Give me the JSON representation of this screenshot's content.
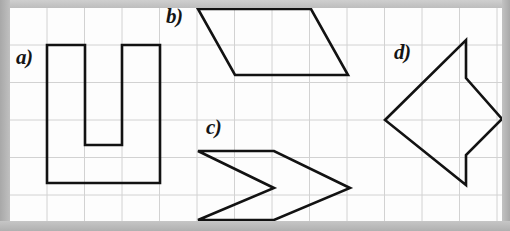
{
  "figure": {
    "background_color": "#bdbdbd",
    "panel_color": "#fdfdfd",
    "grid": {
      "line_color": "#d2d2d2",
      "cell_size": 37.5,
      "origin_x": 9.5,
      "origin_y": 7.5,
      "columns": 13,
      "rows": 6,
      "width": 494,
      "height": 215
    },
    "stroke_color": "#121212",
    "stroke_width": 2.6,
    "labels": [
      {
        "key": "a",
        "text": "a)",
        "x": 16,
        "y": 47
      },
      {
        "key": "b",
        "text": "b)",
        "x": 166,
        "y": 6
      },
      {
        "key": "c",
        "text": "c)",
        "x": 206,
        "y": 117
      },
      {
        "key": "d",
        "text": "d)",
        "x": 394,
        "y": 42
      }
    ],
    "shapes": [
      {
        "key": "a",
        "name": "u-shape-hexagon",
        "label": "a)",
        "vertex_count": 8,
        "points": "47,45 85,45 85,145 122,145 122,45 160,45 160,183 47,183"
      },
      {
        "key": "b",
        "name": "parallelogram",
        "label": "b)",
        "vertex_count": 4,
        "points": "198,9 311,9 348,75 235,75"
      },
      {
        "key": "c",
        "name": "chevron-arrow",
        "label": "c)",
        "vertex_count": 5,
        "points": "198,151 274,151 350,188 274,220 198,220 274,188"
      },
      {
        "key": "d",
        "name": "arrow-kite",
        "label": "d)",
        "vertex_count": 6,
        "points": "466,40 466,78 502,119 466,155 466,185 385,120"
      }
    ]
  }
}
